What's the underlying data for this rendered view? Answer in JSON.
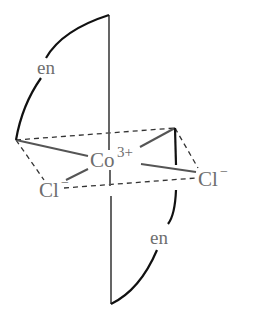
{
  "diagram": {
    "type": "octahedral coordination complex",
    "central_ion": {
      "symbol": "Co",
      "charge": "3+"
    },
    "ligands": [
      {
        "label": "en",
        "position": "upper-left bidentate"
      },
      {
        "label": "en",
        "position": "lower-right bidentate"
      },
      {
        "symbol": "Cl",
        "charge": "−",
        "position": "front-left"
      },
      {
        "symbol": "Cl",
        "charge": "−",
        "position": "right"
      }
    ],
    "labels": {
      "en_top": "en",
      "en_bottom": "en",
      "co_symbol": "Co",
      "co_charge": "3+",
      "cl_left_symbol": "Cl",
      "cl_left_charge": "−",
      "cl_right_symbol": "Cl",
      "cl_right_charge": "−"
    },
    "colors": {
      "bond": "#555555",
      "en_arc": "#111111",
      "dashed": "#333333",
      "text": "#6e6e6e"
    }
  }
}
